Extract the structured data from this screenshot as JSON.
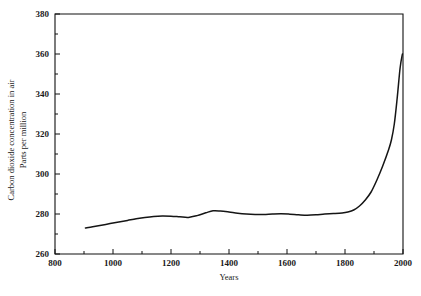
{
  "chart_data": {
    "type": "line",
    "title": "",
    "xlabel": "Years",
    "ylabel": "Carbon dioxide concentration in air\nParts per million",
    "ylabel_line1": "Carbon dioxide concentration in air",
    "ylabel_line2": "Parts per million",
    "xlim": [
      800,
      2000
    ],
    "ylim": [
      260,
      380
    ],
    "grid": false,
    "legend": null,
    "x_major_ticks": [
      800,
      1000,
      1200,
      1400,
      1600,
      1800,
      2000
    ],
    "x_minor_ticks": [
      900,
      1100,
      1300,
      1500,
      1700,
      1900
    ],
    "x_tick_labels": [
      "800",
      "1000",
      "1200",
      "1400",
      "1600",
      "1800",
      "2000"
    ],
    "y_major_ticks": [
      260,
      280,
      300,
      320,
      340,
      360,
      380
    ],
    "y_minor_ticks": [
      270,
      290,
      310,
      330,
      350,
      370
    ],
    "y_tick_labels": [
      "260",
      "280",
      "300",
      "320",
      "340",
      "360",
      "380"
    ],
    "series": [
      {
        "name": "Atmospheric CO2",
        "color": "#151515",
        "x": [
          905,
          930,
          960,
          990,
          1020,
          1050,
          1080,
          1110,
          1140,
          1170,
          1200,
          1230,
          1260,
          1290,
          1320,
          1345,
          1370,
          1400,
          1430,
          1460,
          1490,
          1520,
          1550,
          1580,
          1610,
          1640,
          1670,
          1700,
          1730,
          1760,
          1790,
          1810,
          1830,
          1850,
          1870,
          1890,
          1910,
          1930,
          1950,
          1960,
          1970,
          1980,
          1990,
          1998
        ],
        "values": [
          273.0,
          273.6,
          274.4,
          275.2,
          276.0,
          276.8,
          277.6,
          278.3,
          278.8,
          279.0,
          278.9,
          278.6,
          278.3,
          279.2,
          280.6,
          281.6,
          281.5,
          281.0,
          280.4,
          280.0,
          279.8,
          279.8,
          280.0,
          280.1,
          279.9,
          279.6,
          279.4,
          279.6,
          280.0,
          280.2,
          280.5,
          281.0,
          282.0,
          284.0,
          287.0,
          291.0,
          297.0,
          304.0,
          312.0,
          317.0,
          325.0,
          338.0,
          353.0,
          360.0
        ]
      }
    ]
  },
  "axes": {
    "x_axis_name": "years-axis",
    "y_axis_name": "co2-concentration-axis"
  }
}
